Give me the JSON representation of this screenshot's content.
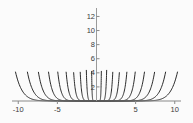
{
  "chart_data": {
    "type": "line",
    "title": "",
    "subtitle": "",
    "xlabel": "",
    "ylabel": "",
    "xlim": [
      -10.8,
      10.8
    ],
    "ylim": [
      0,
      13.2
    ],
    "grid": false,
    "legend": "none",
    "annotations": [],
    "x_ticks": [
      {
        "value": -10,
        "label": "-10"
      },
      {
        "value": -5,
        "label": "-5"
      },
      {
        "value": 5,
        "label": "5"
      },
      {
        "value": 10,
        "label": "10"
      }
    ],
    "y_ticks": [
      {
        "value": 2,
        "label": "2"
      },
      {
        "value": 4,
        "label": "4"
      },
      {
        "value": 6,
        "label": "6"
      },
      {
        "value": 8,
        "label": "8"
      },
      {
        "value": 10,
        "label": "10"
      },
      {
        "value": 12,
        "label": "12"
      }
    ],
    "series": [
      {
        "name": "curve-1",
        "scale": 0.55,
        "exponent": 12,
        "x_at_top": 0.62
      },
      {
        "name": "curve-2",
        "scale": 1.15,
        "exponent": 12,
        "x_at_top": 1.3
      },
      {
        "name": "curve-3",
        "scale": 1.85,
        "exponent": 12,
        "x_at_top": 2.08
      },
      {
        "name": "curve-4",
        "scale": 2.6,
        "exponent": 12,
        "x_at_top": 2.92
      },
      {
        "name": "curve-5",
        "scale": 3.45,
        "exponent": 12,
        "x_at_top": 3.88
      },
      {
        "name": "curve-6",
        "scale": 4.4,
        "exponent": 12,
        "x_at_top": 4.95
      },
      {
        "name": "curve-7",
        "scale": 5.45,
        "exponent": 12,
        "x_at_top": 6.13
      },
      {
        "name": "curve-8",
        "scale": 6.6,
        "exponent": 12,
        "x_at_top": 7.42
      },
      {
        "name": "curve-9",
        "scale": 7.85,
        "exponent": 12,
        "x_at_top": 8.83
      },
      {
        "name": "curve-10",
        "scale": 9.2,
        "exponent": 12,
        "x_at_top": 10.35
      }
    ],
    "mirrored": true,
    "curve_color": "#2b2b2b",
    "axis_color": "#8a8a8a",
    "background_color": "#fbfbfb"
  }
}
